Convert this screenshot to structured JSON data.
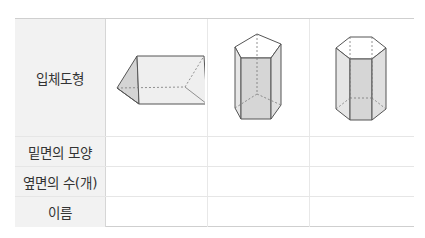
{
  "table": {
    "row_headers": [
      "입체도형",
      "밑면의 모양",
      "옆면의 수(개)",
      "이름"
    ],
    "shapes": [
      {
        "name": "triangular-prism-icon",
        "base_shape": "",
        "side_faces": "",
        "label": ""
      },
      {
        "name": "pentagonal-prism-icon",
        "base_shape": "",
        "side_faces": "",
        "label": ""
      },
      {
        "name": "hexagonal-prism-icon",
        "base_shape": "",
        "side_faces": "",
        "label": ""
      }
    ]
  },
  "colors": {
    "header_bg": "#f2f2f2",
    "face_shade": "#d9d9d9",
    "face_light": "#eeeeee",
    "edge": "#555555"
  }
}
